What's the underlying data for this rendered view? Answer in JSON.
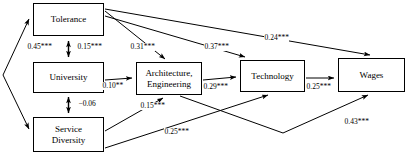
{
  "diagram": {
    "type": "path-diagram",
    "nodes": [
      {
        "id": "tolerance",
        "label": "Tolerance",
        "x": 33,
        "y": 3,
        "w": 71,
        "h": 33
      },
      {
        "id": "university",
        "label": "University",
        "x": 33,
        "y": 62,
        "w": 71,
        "h": 31
      },
      {
        "id": "service",
        "label": "Service\nDiversity",
        "x": 33,
        "y": 117,
        "w": 71,
        "h": 35
      },
      {
        "id": "architecture",
        "label": "Architecture,\nEngineering",
        "x": 136,
        "y": 62,
        "w": 66,
        "h": 33
      },
      {
        "id": "technology",
        "label": "Technology",
        "x": 240,
        "y": 60,
        "w": 65,
        "h": 32
      },
      {
        "id": "wages",
        "label": "Wages",
        "x": 338,
        "y": 58,
        "w": 67,
        "h": 34
      }
    ],
    "edges": [
      {
        "id": "tolerance-university",
        "from": "tolerance",
        "to": "university",
        "coefficient": "0.45***",
        "label_x": 27,
        "label_y": 43,
        "bidirectional": true
      },
      {
        "id": "tolerance-university-2",
        "from": "tolerance",
        "to": "university",
        "coefficient": "0.15***",
        "label_x": 77,
        "label_y": 43,
        "bidirectional": true
      },
      {
        "id": "university-service",
        "from": "university",
        "to": "service",
        "coefficient": "−0.06",
        "label_x": 78,
        "label_y": 100,
        "bidirectional": true
      },
      {
        "id": "tolerance-architecture",
        "from": "tolerance",
        "to": "architecture",
        "coefficient": "0.31***",
        "label_x": 130,
        "label_y": 43,
        "bidirectional": false
      },
      {
        "id": "tolerance-technology",
        "from": "tolerance",
        "to": "technology",
        "coefficient": "0.37***",
        "label_x": 204,
        "label_y": 43,
        "bidirectional": false
      },
      {
        "id": "tolerance-wages",
        "from": "tolerance",
        "to": "wages",
        "coefficient": "0.24***",
        "label_x": 264,
        "label_y": 34,
        "bidirectional": false
      },
      {
        "id": "university-architecture",
        "from": "university",
        "to": "architecture",
        "coefficient": "0.10**",
        "label_x": 102,
        "label_y": 82,
        "bidirectional": false
      },
      {
        "id": "architecture-technology",
        "from": "architecture",
        "to": "technology",
        "coefficient": "0.29***",
        "label_x": 203,
        "label_y": 83,
        "bidirectional": false
      },
      {
        "id": "technology-wages",
        "from": "technology",
        "to": "wages",
        "coefficient": "0.25***",
        "label_x": 306,
        "label_y": 83,
        "bidirectional": false
      },
      {
        "id": "service-architecture",
        "from": "service",
        "to": "architecture",
        "coefficient": "0.15***",
        "label_x": 140,
        "label_y": 102,
        "bidirectional": false
      },
      {
        "id": "service-technology",
        "from": "service",
        "to": "technology",
        "coefficient": "0.25***",
        "label_x": 164,
        "label_y": 128,
        "bidirectional": false
      },
      {
        "id": "architecture-wages",
        "from": "architecture",
        "to": "wages",
        "coefficient": "0.43***",
        "label_x": 344,
        "label_y": 118,
        "bidirectional": false
      }
    ],
    "exogenous_marker": {
      "id": "disturbance-arrows",
      "description": "double-headed angled arrows at far left pointing to Tolerance and Service Diversity"
    }
  }
}
